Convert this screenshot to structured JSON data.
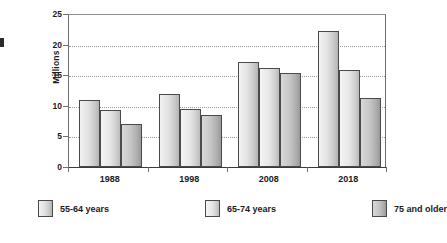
{
  "chart_data": {
    "type": "bar",
    "title": "",
    "subtitle": "",
    "xlabel": "",
    "ylabel": "Millions",
    "categories": [
      "1988",
      "1998",
      "2008",
      "2018"
    ],
    "series": [
      {
        "name": "55-64 years",
        "values": [
          11.0,
          12.0,
          17.2,
          22.2
        ],
        "color": "#e3e3e3"
      },
      {
        "name": "65-74 years",
        "values": [
          9.3,
          9.5,
          16.1,
          15.9
        ],
        "color": "#e8e8e8"
      },
      {
        "name": "75 and older",
        "values": [
          7.1,
          8.5,
          15.4,
          11.3
        ],
        "color": "#c6c6c6"
      }
    ],
    "ylim": [
      0,
      25
    ],
    "ytick_values": [
      0,
      5,
      10,
      15,
      20,
      25
    ],
    "ytick_labels": [
      "0",
      "5",
      "10",
      "15",
      "20",
      "25"
    ],
    "grid": "horizontal-dotted",
    "legend_position": "bottom"
  },
  "axis": {
    "y_title": "Millions",
    "ticks": [
      "25",
      "20",
      "15",
      "10",
      "5",
      "0"
    ]
  },
  "x_labels": [
    "1988",
    "1998",
    "2008",
    "2018"
  ],
  "legend": {
    "items": [
      {
        "label": "55-64 years"
      },
      {
        "label": "65-74 years"
      },
      {
        "label": "75 and older"
      }
    ]
  }
}
